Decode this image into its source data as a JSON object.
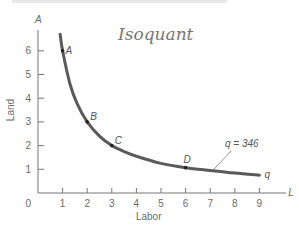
{
  "chart_data": {
    "type": "line",
    "title": "",
    "annotation_handwritten": "Isoquant",
    "xlabel": "Labor",
    "ylabel": "Land",
    "x_axis_symbol": "L",
    "y_axis_symbol": "A",
    "xlim": [
      0,
      9.6
    ],
    "ylim": [
      0,
      7
    ],
    "x_ticks": [
      1,
      2,
      3,
      4,
      5,
      6,
      7,
      8,
      9
    ],
    "y_ticks": [
      1,
      2,
      3,
      4,
      5,
      6
    ],
    "origin_label": "0",
    "grid": false,
    "series": [
      {
        "name": "q = 346",
        "end_label": "q",
        "points": [
          [
            0.9,
            6.7
          ],
          [
            1.0,
            6.0
          ],
          [
            1.3,
            4.6
          ],
          [
            1.6,
            3.75
          ],
          [
            2.0,
            3.0
          ],
          [
            2.5,
            2.4
          ],
          [
            3.0,
            2.0
          ],
          [
            3.5,
            1.75
          ],
          [
            4.0,
            1.55
          ],
          [
            5.0,
            1.25
          ],
          [
            6.0,
            1.07
          ],
          [
            7.0,
            0.95
          ],
          [
            8.0,
            0.84
          ],
          [
            9.0,
            0.75
          ]
        ]
      }
    ],
    "labeled_points": [
      {
        "label": "A",
        "x": 1,
        "y": 6
      },
      {
        "label": "B",
        "x": 2,
        "y": 3
      },
      {
        "label": "C",
        "x": 3,
        "y": 2
      },
      {
        "label": "D",
        "x": 6,
        "y": 1.07
      }
    ],
    "curve_label": "q = 346",
    "colors": {
      "curve": "#5a5a5a",
      "axis": "#777777",
      "text": "#6a6a6a"
    }
  }
}
